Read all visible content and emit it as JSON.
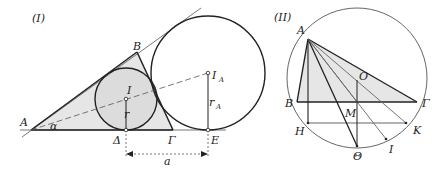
{
  "figure_I": {
    "title": "(I)",
    "points": {
      "A": "A",
      "B": "B",
      "Gamma": "Γ",
      "Delta": "Δ",
      "E": "E",
      "I": "I",
      "I_A_main": "I",
      "I_A_sub": "A"
    },
    "labels": {
      "alpha": "α",
      "r": "r",
      "r_A_main": "r",
      "r_A_sub": "A",
      "a": "a"
    }
  },
  "figure_II": {
    "title": "(II)",
    "points": {
      "A": "A",
      "B": "B",
      "Gamma": "Γ",
      "O": "O",
      "M": "M",
      "H": "H",
      "K": "K",
      "Theta": "Θ",
      "I": "I"
    }
  },
  "colors": {
    "line": "#222222",
    "thin_line": "#555555",
    "fill": "#e6e6e6"
  }
}
